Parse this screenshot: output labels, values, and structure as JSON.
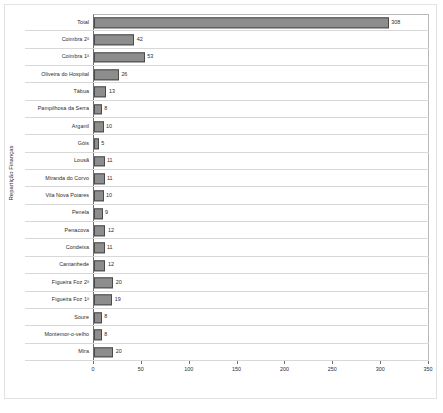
{
  "chart_data": {
    "type": "bar",
    "orientation": "horizontal",
    "title": "",
    "xlabel": "",
    "ylabel": "Repartição Finanças",
    "xlim": [
      0,
      350
    ],
    "xticks": [
      0,
      50,
      100,
      150,
      200,
      250,
      300,
      350
    ],
    "xtick_labels": [
      "0",
      "50",
      "100",
      "150",
      "200",
      "250",
      "300",
      "350"
    ],
    "grid": false,
    "legend": false,
    "bar_color": "#8d8d8d",
    "bar_edge_color": "#4a4a4a",
    "categories": [
      "Total",
      "Coimbra 2ª",
      "Coimbra 1ª",
      "Oliveira do Hospital",
      "Tábua",
      "Pampilhosa da Serra",
      "Arganil",
      "Góis",
      "Lousã",
      "Miranda do Corvo",
      "Vila Nova Poiares",
      "Penela",
      "Penacova",
      "Condeixa",
      "Cantanhede",
      "Figueira Foz 2ª",
      "Figueira Foz 1ª",
      "Soure",
      "Montemor-o-velho",
      "Mira"
    ],
    "values": [
      308,
      42,
      53,
      26,
      13,
      8,
      10,
      5,
      11,
      11,
      10,
      9,
      12,
      11,
      12,
      20,
      19,
      8,
      8,
      20
    ],
    "value_labels": [
      "308",
      "42",
      "53",
      "26",
      "13",
      "8",
      "10",
      "5",
      "11",
      "11",
      "10",
      "9",
      "12",
      "11",
      "12",
      "20",
      "19",
      "8",
      "8",
      "20"
    ]
  }
}
